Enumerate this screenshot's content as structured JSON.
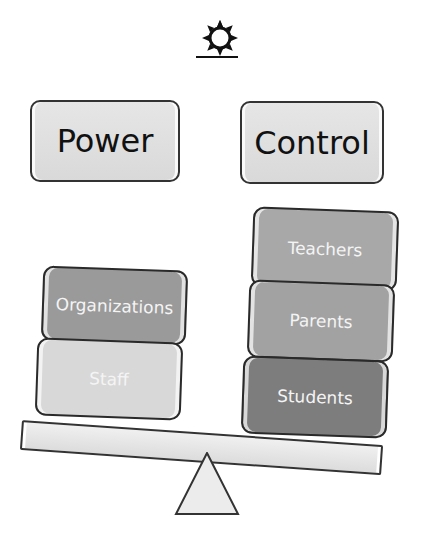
{
  "header": {
    "icon": "sun-icon"
  },
  "concepts": {
    "left": "Power",
    "right": "Control"
  },
  "scale": {
    "left_blocks": [
      {
        "label": "Organizations",
        "color": "#9a9a9a"
      },
      {
        "label": "Staff",
        "color": "#d8d8d8"
      }
    ],
    "right_blocks": [
      {
        "label": "Teachers",
        "color": "#a8a8a8"
      },
      {
        "label": "Parents",
        "color": "#a2a2a2"
      },
      {
        "label": "Students",
        "color": "#7d7d7d"
      }
    ],
    "beam": "seesaw-beam",
    "fulcrum": "triangle-fulcrum"
  }
}
